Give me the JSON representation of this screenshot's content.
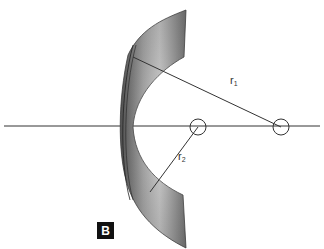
{
  "figure": {
    "panel_label": "B",
    "labels": {
      "r1": {
        "base": "r",
        "sub": "1"
      },
      "r2": {
        "base": "r",
        "sub": "2"
      }
    },
    "elements": {
      "lens": "meniscus-lens-cross-section",
      "optical_axis": "horizontal-line",
      "center_of_curvature_1": "circle-marker-right",
      "center_of_curvature_2": "circle-marker-left"
    },
    "colors": {
      "line": "#333333",
      "lens_dark": "#6a6a6a",
      "lens_light": "#cfcfcf",
      "badge_bg": "#111111",
      "badge_fg": "#ffffff"
    }
  }
}
